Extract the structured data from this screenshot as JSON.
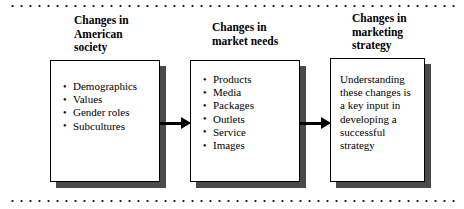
{
  "figure": {
    "background_color": "#ffffff",
    "ink_color": "#000000",
    "shadow_color": "#4a4a4a"
  },
  "rules": {
    "top_label": "dotted-rule-top",
    "bottom_label": "dotted-rule-bottom"
  },
  "stages": [
    {
      "id": "american-society",
      "header": "Changes in\nAmerican\nsociety",
      "kind": "bullet-list",
      "items": [
        "Demographics",
        "Values",
        "Gender roles",
        "Subcultures"
      ]
    },
    {
      "id": "market-needs",
      "header": "Changes in\nmarket needs",
      "kind": "bullet-list",
      "items": [
        "Products",
        "Media",
        "Packages",
        "Outlets",
        "Service",
        "Images"
      ]
    },
    {
      "id": "marketing-strategy",
      "header": "Changes in\nmarketing\nstrategy",
      "kind": "paragraph",
      "text": "Understanding these changes is a key input in developing a successful strategy"
    }
  ],
  "connectors": [
    {
      "id": "arrow-society-to-market",
      "from": "american-society",
      "to": "market-needs",
      "direction": "right"
    },
    {
      "id": "arrow-market-to-strategy",
      "from": "market-needs",
      "to": "marketing-strategy",
      "direction": "right"
    }
  ]
}
